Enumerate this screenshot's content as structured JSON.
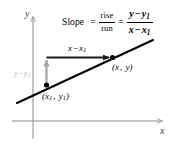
{
  "figure": {
    "axes": {
      "y_label": "y",
      "x_label": "x"
    },
    "formula": {
      "word": "Slope",
      "equals_1": "=",
      "rise": "rise",
      "run": "run",
      "equals_2": "=",
      "numerator_left": "y",
      "numerator_minus": "−",
      "numerator_right": "y",
      "numerator_right_sub": "1",
      "denominator_left": "x",
      "denominator_minus": "−",
      "denominator_right": "x",
      "denominator_right_sub": "1"
    },
    "points": [
      {
        "name": "point-1",
        "label_open": "(",
        "label_x": "x",
        "label_x_sub": "1",
        "label_comma": ", ",
        "label_y": "y",
        "label_y_sub": "1",
        "label_close": ")"
      },
      {
        "name": "point-2",
        "label_open": "(",
        "label_x": "x",
        "label_comma": ", ",
        "label_y": "y",
        "label_close": ")"
      }
    ],
    "run_arrow_label": {
      "left": "x",
      "minus": "−",
      "right": "x",
      "right_sub": "1"
    },
    "rise_arrow_label": {
      "left": "y",
      "minus": "−",
      "right": "y",
      "right_sub": "1"
    },
    "colors": {
      "line": "#000000",
      "axis": "#8a8a8a",
      "run_arrow": "#1a1a1a",
      "rise_arrow": "#a6a6a6",
      "rise_label": "#b9b9b9",
      "background": "#ffffff"
    }
  }
}
